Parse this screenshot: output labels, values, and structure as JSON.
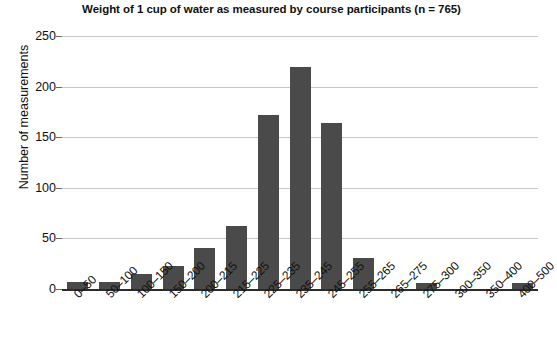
{
  "chart_data": {
    "type": "bar",
    "title": "Weight of 1 cup of water as measured by course participants (n = 765)",
    "xlabel": "",
    "ylabel": "Number of measurements",
    "categories": [
      "0–50",
      "50–100",
      "100–150",
      "150–200",
      "200–215",
      "215–225",
      "225–235",
      "235–245",
      "245–255",
      "255–265",
      "265–275",
      "275–300",
      "300–350",
      "350–400",
      "400–500"
    ],
    "values": [
      7,
      7,
      15,
      23,
      41,
      62,
      172,
      219,
      164,
      31,
      0,
      6,
      0,
      0,
      6
    ],
    "ylim": [
      0,
      250
    ],
    "yticks": [
      0,
      50,
      100,
      150,
      200,
      250
    ],
    "ytick_labels": [
      "0",
      "50",
      "100",
      "150",
      "200",
      "250"
    ],
    "grid": true,
    "grid_axis": "y",
    "legend": false,
    "bar_color": "#4a4a4a",
    "grid_color": "#c8c8c8",
    "axis_color": "#2b2b2b",
    "sample_size": 765
  }
}
